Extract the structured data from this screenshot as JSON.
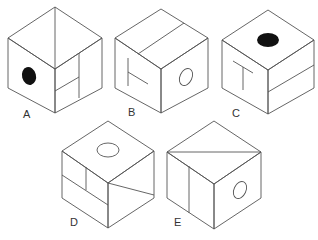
{
  "diagram": {
    "type": "cube-folding-options",
    "options": [
      {
        "label": "A",
        "faces": {
          "top": "diagonal line",
          "left": "solid black oval",
          "right": "vertical line with small rectangle split"
        }
      },
      {
        "label": "B",
        "faces": {
          "top": "line across",
          "left": "T shape (rotated)",
          "right": "hollow oval"
        }
      },
      {
        "label": "C",
        "faces": {
          "top": "solid black oval",
          "left": "T shape",
          "right": "horizontal line"
        }
      },
      {
        "label": "D",
        "faces": {
          "top": "hollow oval",
          "left": "T-split lines",
          "right": "diagonal line"
        }
      },
      {
        "label": "E",
        "faces": {
          "top": "diagonal line",
          "left": "vertical line",
          "right": "hollow oval"
        }
      }
    ]
  },
  "colors": {
    "line": "#555555",
    "fill_dark": "#111111",
    "label": "#333333"
  }
}
